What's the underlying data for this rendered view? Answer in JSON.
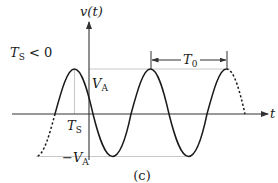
{
  "figure": {
    "caption": "(c)",
    "condition_label": "T",
    "condition_sub": "S",
    "condition_rest": " < 0",
    "y_axis_label": "v(t)",
    "x_axis_label": "t",
    "peak_label": "V",
    "peak_sub": "A",
    "trough_label": "−V",
    "trough_sub": "A",
    "shift_label": "T",
    "shift_sub": "S",
    "period_label": "T",
    "period_sub": "0"
  },
  "colors": {
    "curve": "#1a1a1a",
    "axis": "#333333",
    "guide": "#c8c8c8"
  }
}
